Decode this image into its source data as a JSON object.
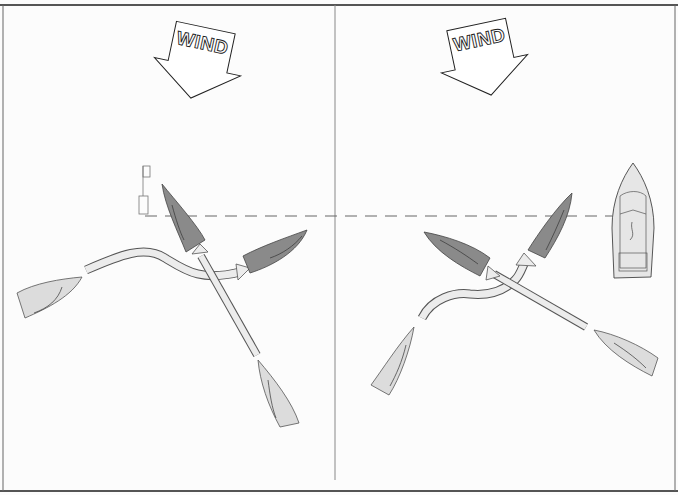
{
  "diagram": {
    "type": "sailing-rules-of-the-road",
    "colors": {
      "background": "#fcfcfc",
      "frame": "#444444",
      "dark_boat": "#8a8a8a",
      "light_boat": "#d9d9d9",
      "path_fill": "#ececec",
      "outline": "#333333",
      "dashed_line": "#666666"
    },
    "panels": [
      {
        "id": "left",
        "wind_label": "WIND",
        "wind_icon": "wind-arrow-down",
        "elements": [
          "mark-flag-buoy",
          "dark-boat-upright",
          "dark-boat-heading-right",
          "light-boat-left",
          "light-boat-bottom",
          "curved-path-arrow",
          "straight-path-arrow"
        ]
      },
      {
        "id": "right",
        "wind_label": "WIND",
        "wind_icon": "wind-arrow-down",
        "elements": [
          "committee-powerboat",
          "dark-boat-upright",
          "dark-boat-heading-left",
          "light-boat-left",
          "light-boat-right",
          "curved-path-arrow",
          "straight-path-arrow"
        ]
      }
    ],
    "start_line": "dashed"
  }
}
